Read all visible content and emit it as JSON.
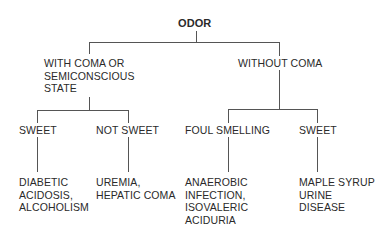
{
  "diagram": {
    "root": {
      "label": "ODOR"
    },
    "level1": [
      {
        "id": "with-coma",
        "lines": [
          "WITH COMA OR",
          "SEMICONSCIOUS",
          "STATE"
        ]
      },
      {
        "id": "without-coma",
        "lines": [
          "WITHOUT COMA"
        ]
      }
    ],
    "level2": [
      {
        "id": "sweet-coma",
        "parent": "with-coma",
        "label": "SWEET"
      },
      {
        "id": "not-sweet",
        "parent": "with-coma",
        "label": "NOT SWEET"
      },
      {
        "id": "foul-smelling",
        "parent": "without-coma",
        "label": "FOUL SMELLING"
      },
      {
        "id": "sweet-nocoma",
        "parent": "without-coma",
        "label": "SWEET"
      }
    ],
    "leaves": [
      {
        "parent": "sweet-coma",
        "lines": [
          "DIABETIC",
          "ACIDOSIS,",
          "ALCOHOLISM"
        ]
      },
      {
        "parent": "not-sweet",
        "lines": [
          "UREMIA,",
          "HEPATIC COMA"
        ]
      },
      {
        "parent": "foul-smelling",
        "lines": [
          "ANAEROBIC",
          "INFECTION,",
          "ISOVALERIC",
          "ACIDURIA"
        ]
      },
      {
        "parent": "sweet-nocoma",
        "lines": [
          "MAPLE SYRUP",
          "URINE",
          "DISEASE"
        ]
      }
    ]
  }
}
